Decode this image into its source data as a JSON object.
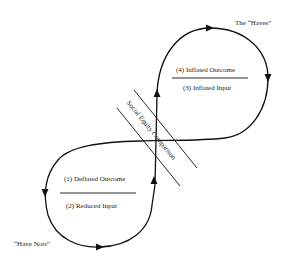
{
  "diagram": {
    "type": "figure-eight cycle",
    "top_loop": {
      "group_label": "The “Haves”",
      "numerator": "(4) Inflated Outcome",
      "denominator": "(3) Inflated Input"
    },
    "bottom_loop": {
      "group_label": "“Have Nots”",
      "numerator": "(1) Deflated Outcome",
      "denominator": "(2) Reduced Input"
    },
    "barrier_label": "Social Equity Comparison",
    "colors": {
      "line": "#111111",
      "text": "#222222",
      "background": "#ffffff"
    }
  }
}
